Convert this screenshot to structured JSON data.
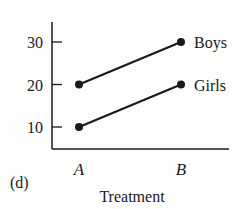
{
  "chart_data": {
    "type": "line",
    "panel_label": "(d)",
    "xlabel": "Treatment",
    "ylabel": "",
    "categories": [
      "A",
      "B"
    ],
    "yticks": [
      10,
      20,
      30
    ],
    "ylim": [
      5,
      35
    ],
    "grid": false,
    "legend_position": "inline-right",
    "series": [
      {
        "name": "Boys",
        "values": [
          20,
          30
        ]
      },
      {
        "name": "Girls",
        "values": [
          10,
          20
        ]
      }
    ]
  }
}
